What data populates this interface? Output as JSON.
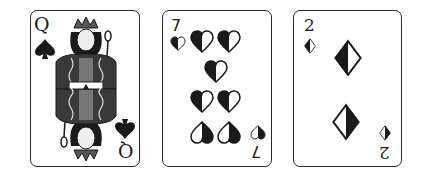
{
  "cards": [
    {
      "rank": "Q",
      "suit": "spades",
      "suit_icon": "spade-icon",
      "type": "face"
    },
    {
      "rank": "7",
      "suit": "hearts",
      "suit_icon": "heart-icon",
      "type": "pip"
    },
    {
      "rank": "2",
      "suit": "diamonds",
      "suit_icon": "diamond-icon",
      "type": "pip"
    }
  ],
  "colors": {
    "ink": "#1a1a1a",
    "border": "#2a2a2a",
    "face_fill": "#3a3a3a",
    "background": "#ffffff"
  }
}
